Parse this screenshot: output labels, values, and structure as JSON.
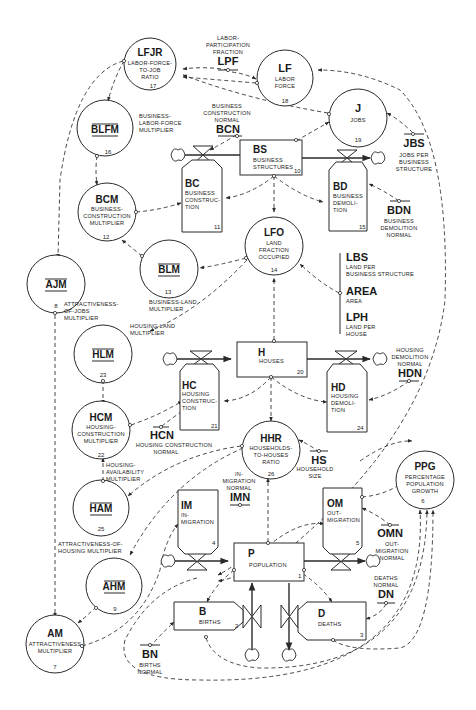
{
  "diagram": {
    "levels": [
      {
        "id": "BS",
        "abbr": "BS",
        "label1": "BUSINESS",
        "label2": "STRUCTURES",
        "num": "10"
      },
      {
        "id": "H",
        "abbr": "H",
        "label1": "HOUSES",
        "label2": "",
        "num": "20"
      },
      {
        "id": "P",
        "abbr": "P",
        "label1": "POPULATION",
        "label2": "",
        "num": "1"
      }
    ],
    "rates": [
      {
        "id": "BC",
        "abbr": "BC",
        "label1": "BUSINESS",
        "label2": "CONSTRUC-",
        "label3": "TION",
        "num": "11"
      },
      {
        "id": "BD",
        "abbr": "BD",
        "label1": "BUSINESS",
        "label2": "DEMOLI-",
        "label3": "TION",
        "num": "15"
      },
      {
        "id": "HC",
        "abbr": "HC",
        "label1": "HOUSING",
        "label2": "CONSTRUC-",
        "label3": "TION",
        "num": "21"
      },
      {
        "id": "HD",
        "abbr": "HD",
        "label1": "HOUSING",
        "label2": "DEMOLI-",
        "label3": "TION",
        "num": "24"
      },
      {
        "id": "IM",
        "abbr": "IM",
        "label1": "IN-",
        "label2": "MIGRATION",
        "label3": "",
        "num": "4"
      },
      {
        "id": "OM",
        "abbr": "OM",
        "label1": "OUT-",
        "label2": "MIGRATION",
        "label3": "",
        "num": "5"
      },
      {
        "id": "B",
        "abbr": "B",
        "label1": "BIRTHS",
        "label2": "",
        "label3": "",
        "num": "2"
      },
      {
        "id": "D",
        "abbr": "D",
        "label1": "DEATHS",
        "label2": "",
        "label3": "",
        "num": "3"
      }
    ],
    "auxiliaries": [
      {
        "id": "LFJR",
        "abbr": "LFJR",
        "label1": "LABOR-FORCE-",
        "label2": "TO-JOB",
        "label3": "RATIO",
        "num": "17"
      },
      {
        "id": "LF",
        "abbr": "LF",
        "label1": "LABOR",
        "label2": "FORCE",
        "label3": "",
        "num": "18"
      },
      {
        "id": "J",
        "abbr": "J",
        "label1": "JOBS",
        "label2": "",
        "label3": "",
        "num": "19"
      },
      {
        "id": "BLFM",
        "abbr": "BLFM",
        "label1": "",
        "label2": "",
        "label3": "",
        "num": "16"
      },
      {
        "id": "BCM",
        "abbr": "BCM",
        "label1": "BUSINESS-",
        "label2": "CONSTRUCTION",
        "label3": "MULTIPLIER",
        "num": "12"
      },
      {
        "id": "BLM",
        "abbr": "BLM",
        "label1": "",
        "label2": "",
        "label3": "",
        "num": "13"
      },
      {
        "id": "LFO",
        "abbr": "LFO",
        "label1": "LAND",
        "label2": "FRACTION",
        "label3": "OCCUPIED",
        "num": "14"
      },
      {
        "id": "AJM",
        "abbr": "AJM",
        "label1": "",
        "label2": "",
        "label3": "",
        "num": "8"
      },
      {
        "id": "HLM",
        "abbr": "HLM",
        "label1": "",
        "label2": "",
        "label3": "",
        "num": "23"
      },
      {
        "id": "HCM",
        "abbr": "HCM",
        "label1": "HOUSING-",
        "label2": "CONSTRUCTION",
        "label3": "MULTIPLIER",
        "num": "22"
      },
      {
        "id": "HAM",
        "abbr": "HAM",
        "label1": "",
        "label2": "",
        "label3": "",
        "num": "25"
      },
      {
        "id": "HHR",
        "abbr": "HHR",
        "label1": "HOUSEHOLDS-",
        "label2": "TO-HOUSES",
        "label3": "RATIO",
        "num": "26"
      },
      {
        "id": "AHM",
        "abbr": "AHM",
        "label1": "",
        "label2": "",
        "label3": "",
        "num": "9"
      },
      {
        "id": "AM",
        "abbr": "AM",
        "label1": "ATTRACTIVENESS",
        "label2": "MULTIPLIER",
        "label3": "",
        "num": "7"
      },
      {
        "id": "PPG",
        "abbr": "PPG",
        "label1": "PERCENTAGE",
        "label2": "POPULATION",
        "label3": "GROWTH",
        "num": "6"
      }
    ],
    "external_labels": {
      "BLFM": [
        "BUSINESS-",
        "LABOR-FORCE",
        "MULTIPLIER"
      ],
      "BLM": [
        "BUSINESS-LAND",
        "MULTIPLIER"
      ],
      "AJM": [
        "ATTRACTIVENESS-",
        "OF-JOBS",
        "MULTIPLIER"
      ],
      "HLM": [
        "HOUSING-LAND",
        "MULTIPLIER"
      ],
      "HAM": [
        "HOUSING-",
        "AVAILABILITY",
        "MULTIPLIER"
      ],
      "AHM": [
        "ATTRACTIVENESS-OF-",
        "HOUSING MULTIPLIER"
      ]
    },
    "constants": [
      {
        "id": "LPF",
        "abbr": "LPF",
        "label1": "LABOR-",
        "label2": "PARTICIPATION",
        "label3": "FRACTION"
      },
      {
        "id": "BCN",
        "abbr": "BCN",
        "label1": "BUSINESS",
        "label2": "CONSTRUCTION",
        "label3": "NORMAL"
      },
      {
        "id": "JBS",
        "abbr": "JBS",
        "label1": "JOBS PER",
        "label2": "BUSINESS",
        "label3": "STRUCTURE"
      },
      {
        "id": "BDN",
        "abbr": "BDN",
        "label1": "BUSINESS",
        "label2": "DEMOLITION",
        "label3": "NORMAL"
      },
      {
        "id": "LBS",
        "abbr": "LBS",
        "label1": "LAND PER",
        "label2": "BUSINESS STRUCTURE",
        "label3": ""
      },
      {
        "id": "AREA",
        "abbr": "AREA",
        "label1": "AREA",
        "label2": "",
        "label3": ""
      },
      {
        "id": "LPH",
        "abbr": "LPH",
        "label1": "LAND PER",
        "label2": "HOUSE",
        "label3": ""
      },
      {
        "id": "HCN",
        "abbr": "HCN",
        "label1": "HOUSING CONSTRUCTION",
        "label2": "NORMAL",
        "label3": ""
      },
      {
        "id": "HDN",
        "abbr": "HDN",
        "label1": "HOUSING",
        "label2": "DEMOLITION",
        "label3": "NORMAL"
      },
      {
        "id": "HS",
        "abbr": "HS",
        "label1": "HOUSEHOLD",
        "label2": "SIZE",
        "label3": ""
      },
      {
        "id": "IMN",
        "abbr": "IMN",
        "label1": "IN-",
        "label2": "MIGRATION",
        "label3": "NORMAL"
      },
      {
        "id": "OMN",
        "abbr": "OMN",
        "label1": "OUT-",
        "label2": "MIGRATION",
        "label3": "NORMAL"
      },
      {
        "id": "DN",
        "abbr": "DN",
        "label1": "DEATHS",
        "label2": "NORMAL",
        "label3": ""
      },
      {
        "id": "BN",
        "abbr": "BN",
        "label1": "BIRTHS",
        "label2": "NORMAL",
        "label3": ""
      }
    ]
  }
}
